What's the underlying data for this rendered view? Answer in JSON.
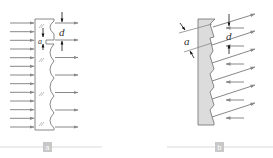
{
  "diagram": {
    "panels": [
      {
        "id": "a",
        "caption": "a",
        "description": "Plane wave incident on a plate with a scalloped (lenslet) exit surface",
        "incoming_arrows": 13,
        "outgoing_arrows": 7,
        "labels": {
          "period": "d",
          "width": "a"
        }
      },
      {
        "id": "b",
        "caption": "b",
        "description": "Sawtooth (echelette) grating plate with diffracted oblique rays",
        "oblique_arrows": 6,
        "reverse_arrows": 6,
        "labels": {
          "period": "d",
          "width": "a"
        }
      }
    ],
    "colors": {
      "arrow": "#888888",
      "outline": "#7a7a7a",
      "plate_fill_b": "#dcdcdc",
      "caption_box": "#c8c8c8",
      "caption_line": "#c8c8c8",
      "label": "#333333"
    }
  }
}
